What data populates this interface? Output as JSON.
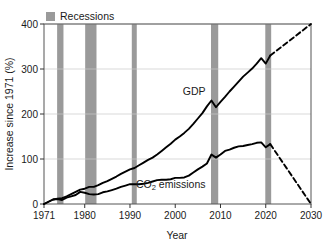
{
  "chart_data": {
    "type": "line",
    "title": "",
    "xlabel": "Year",
    "ylabel": "Increase since 1971 (%)",
    "xlim": [
      1971,
      2030
    ],
    "ylim": [
      0,
      400
    ],
    "xticks": [
      1971,
      1980,
      1990,
      2000,
      2010,
      2020,
      2030
    ],
    "xtick_labels": [
      "1971",
      "1980",
      "1990",
      "2000",
      "2010",
      "2020",
      "2030"
    ],
    "yticks": [
      0,
      100,
      200,
      300,
      400
    ],
    "ytick_labels": [
      "0",
      "100",
      "200",
      "300",
      "400"
    ],
    "grid": "horizontal",
    "legend": {
      "position": "above-plot-left",
      "entries": [
        {
          "label": "Recessions",
          "color": "#9a9a9a",
          "marker": "square"
        }
      ]
    },
    "annotations": [
      {
        "text": "GDP",
        "x": 2004.2,
        "y": 243,
        "series": "GDP"
      },
      {
        "text": "CO2 emissions",
        "x": 1999.0,
        "y": 36,
        "series": "CO2 emissions",
        "subscript": "2"
      }
    ],
    "shaded_bands": {
      "name": "Recessions",
      "color": "#9a9a9a",
      "ranges": [
        [
          1973.9,
          1975.3
        ],
        [
          1980.1,
          1982.6
        ],
        [
          1990.4,
          1991.5
        ],
        [
          2007.9,
          2009.5
        ],
        [
          2019.9,
          2021.2
        ]
      ]
    },
    "series": [
      {
        "name": "GDP",
        "color": "#000000",
        "style": "solid",
        "x": [
          1971,
          1972,
          1973,
          1974,
          1975,
          1976,
          1977,
          1978,
          1979,
          1980,
          1981,
          1982,
          1983,
          1984,
          1985,
          1986,
          1987,
          1988,
          1989,
          1990,
          1991,
          1992,
          1993,
          1994,
          1995,
          1996,
          1997,
          1998,
          1999,
          2000,
          2001,
          2002,
          2003,
          2004,
          2005,
          2006,
          2007,
          2008,
          2009,
          2010,
          2011,
          2012,
          2013,
          2014,
          2015,
          2016,
          2017,
          2018,
          2019,
          2020,
          2021
        ],
        "y": [
          0,
          5,
          10,
          12,
          13,
          17,
          22,
          27,
          32,
          34,
          38,
          38,
          42,
          47,
          51,
          56,
          61,
          67,
          72,
          77,
          80,
          86,
          92,
          98,
          103,
          110,
          118,
          126,
          134,
          143,
          150,
          158,
          167,
          178,
          190,
          202,
          217,
          230,
          215,
          227,
          238,
          250,
          261,
          272,
          283,
          292,
          301,
          312,
          324,
          312,
          330
        ]
      },
      {
        "name": "GDP projection",
        "color": "#000000",
        "style": "dashed",
        "x": [
          2021,
          2030
        ],
        "y": [
          330,
          400
        ]
      },
      {
        "name": "CO2 emissions",
        "color": "#000000",
        "style": "solid",
        "x": [
          1971,
          1972,
          1973,
          1974,
          1975,
          1976,
          1977,
          1978,
          1979,
          1980,
          1981,
          1982,
          1983,
          1984,
          1985,
          1986,
          1987,
          1988,
          1989,
          1990,
          1991,
          1992,
          1993,
          1994,
          1995,
          1996,
          1997,
          1998,
          1999,
          2000,
          2001,
          2002,
          2003,
          2004,
          2005,
          2006,
          2007,
          2008,
          2009,
          2010,
          2011,
          2012,
          2013,
          2014,
          2015,
          2016,
          2017,
          2018,
          2019,
          2020,
          2021
        ],
        "y": [
          0,
          5,
          10,
          11,
          9,
          14,
          17,
          20,
          27,
          25,
          22,
          21,
          22,
          26,
          28,
          31,
          34,
          38,
          41,
          44,
          44,
          44,
          45,
          47,
          50,
          53,
          54,
          54,
          55,
          58,
          58,
          59,
          63,
          70,
          77,
          83,
          90,
          110,
          103,
          110,
          118,
          121,
          125,
          128,
          129,
          131,
          133,
          136,
          137,
          126,
          133
        ]
      },
      {
        "name": "CO2 emissions projection",
        "color": "#000000",
        "style": "dashed",
        "x": [
          2021,
          2030
        ],
        "y": [
          133,
          0
        ]
      }
    ]
  },
  "axes": {
    "y_title": "Increase since 1971 (%)",
    "x_title": "Year"
  }
}
